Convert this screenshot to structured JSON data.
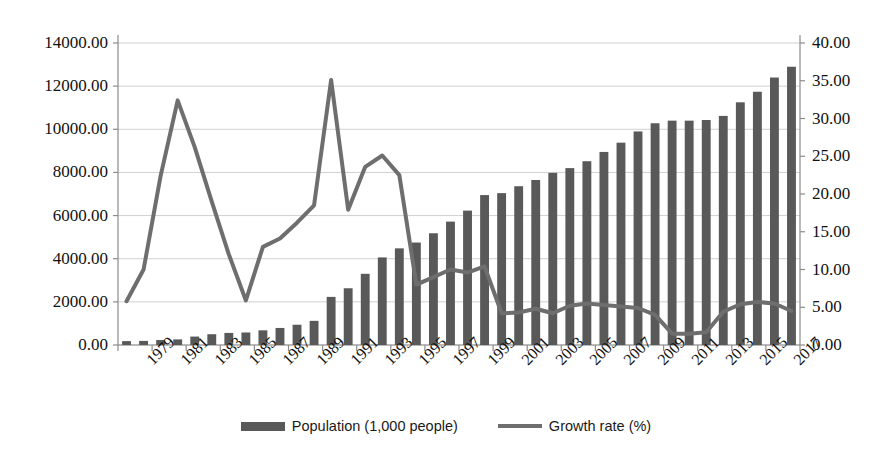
{
  "chart_data": {
    "type": "bar",
    "title": "",
    "subtitle": "",
    "xlabel": "",
    "ylabel": "",
    "grid": true,
    "legend_position": "bottom",
    "x": [
      1979,
      1980,
      1981,
      1982,
      1983,
      1984,
      1985,
      1986,
      1987,
      1988,
      1989,
      1990,
      1991,
      1992,
      1993,
      1994,
      1995,
      1996,
      1997,
      1998,
      1999,
      2000,
      2001,
      2002,
      2003,
      2004,
      2005,
      2006,
      2007,
      2008,
      2009,
      2010,
      2011,
      2012,
      2013,
      2014,
      2015,
      2016,
      2017,
      2018
    ],
    "categories": [
      "1979",
      "1980",
      "1981",
      "1982",
      "1983",
      "1984",
      "1985",
      "1986",
      "1987",
      "1988",
      "1989",
      "1990",
      "1991",
      "1992",
      "1993",
      "1994",
      "1995",
      "1996",
      "1997",
      "1998",
      "1999",
      "2000",
      "2001",
      "2002",
      "2003",
      "2004",
      "2005",
      "2006",
      "2007",
      "2008",
      "2009",
      "2010",
      "2011",
      "2012",
      "2013",
      "2014",
      "2015",
      "2016",
      "2017",
      "2018"
    ],
    "xtick_labels": [
      "1979",
      "1981",
      "1983",
      "1985",
      "1987",
      "1989",
      "1991",
      "1993",
      "1995",
      "1997",
      "1999",
      "2001",
      "2003",
      "2005",
      "2007",
      "2009",
      "2011",
      "2013",
      "2015",
      "2017"
    ],
    "xtick_step_years": 2,
    "ylim": [
      0,
      14000
    ],
    "yticks": [
      0,
      2000,
      4000,
      6000,
      8000,
      10000,
      12000,
      14000
    ],
    "ytick_labels": [
      "0.00",
      "2000.00",
      "4000.00",
      "6000.00",
      "8000.00",
      "10000.00",
      "12000.00",
      "14000.00"
    ],
    "y2lim": [
      0,
      40
    ],
    "y2ticks": [
      0,
      5,
      10,
      15,
      20,
      25,
      30,
      35,
      40
    ],
    "y2tick_labels": [
      "0.00",
      "5.00",
      "10.00",
      "15.00",
      "20.00",
      "25.00",
      "30.00",
      "35.00",
      "40.00"
    ],
    "series": [
      {
        "name": "Population (1,000 people)",
        "type": "bar",
        "axis": "left",
        "color": "#595959",
        "values": [
          180,
          190,
          230,
          260,
          390,
          500,
          560,
          580,
          680,
          790,
          940,
          1120,
          2230,
          2630,
          3300,
          4060,
          4480,
          4750,
          5180,
          5720,
          6230,
          6950,
          7040,
          7360,
          7650,
          7980,
          8200,
          8520,
          8950,
          9380,
          9900,
          10280,
          10400,
          10400,
          10430,
          10620,
          11250,
          11740,
          12400,
          12900
        ]
      },
      {
        "name": "Growth rate (%)",
        "type": "line",
        "axis": "right",
        "color": "#6e6e6e",
        "values": [
          5.8,
          10.0,
          22.4,
          32.4,
          26.2,
          19.0,
          12.0,
          5.9,
          13.0,
          14.1,
          16.2,
          18.5,
          35.1,
          17.9,
          23.6,
          25.1,
          22.5,
          8.0,
          9.0,
          10.0,
          9.6,
          10.4,
          4.2,
          4.3,
          4.8,
          4.2,
          5.2,
          5.5,
          5.3,
          5.1,
          4.9,
          4.0,
          1.5,
          1.5,
          1.7,
          4.4,
          5.4,
          5.7,
          5.5,
          4.5
        ]
      }
    ]
  },
  "legend": {
    "items": [
      {
        "label": "Population (1,000 people)",
        "marker": "bar-swatch"
      },
      {
        "label": "Growth rate (%)",
        "marker": "line-swatch"
      }
    ]
  },
  "colors": {
    "bar": "#595959",
    "line": "#6e6e6e",
    "grid": "#d0d0d0",
    "axis": "#8c8c8c",
    "text": "#111111",
    "background": "#ffffff"
  }
}
